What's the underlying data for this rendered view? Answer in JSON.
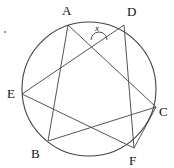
{
  "figure": {
    "type": "circle-geometry-diagram",
    "stroke_color": "#555555",
    "circle_color": "#444444",
    "label_color": "#111111",
    "background": "#ffffff",
    "circle": {
      "cx": 89,
      "cy": 89,
      "r": 67
    },
    "points": [
      {
        "id": "A",
        "label": "A",
        "x": 68,
        "y": 25,
        "label_x": 62,
        "label_y": 15
      },
      {
        "id": "D",
        "label": "D",
        "x": 124,
        "y": 25,
        "label_x": 127,
        "label_y": 16
      },
      {
        "id": "E",
        "label": "E",
        "x": 22,
        "y": 94,
        "label_x": 7,
        "label_y": 98
      },
      {
        "id": "C",
        "label": "C",
        "x": 156,
        "y": 107,
        "label_x": 159,
        "label_y": 116
      },
      {
        "id": "B",
        "label": "B",
        "x": 48,
        "y": 141,
        "label_x": 31,
        "label_y": 158
      },
      {
        "id": "F",
        "label": "F",
        "x": 134,
        "y": 148,
        "label_x": 129,
        "label_y": 165
      }
    ],
    "chords": [
      {
        "from": "A",
        "to": "C"
      },
      {
        "from": "A",
        "to": "B"
      },
      {
        "from": "D",
        "to": "E"
      },
      {
        "from": "D",
        "to": "F"
      },
      {
        "from": "E",
        "to": "F"
      },
      {
        "from": "B",
        "to": "C"
      },
      {
        "from": "F",
        "to": "C"
      }
    ],
    "angle_marker": {
      "label": "x",
      "label_x": 95,
      "label_y": 31,
      "arc_cx": 99,
      "arc_cy": 40,
      "arc_r": 8
    },
    "stray_mark": {
      "x": 5,
      "y": 32
    }
  }
}
